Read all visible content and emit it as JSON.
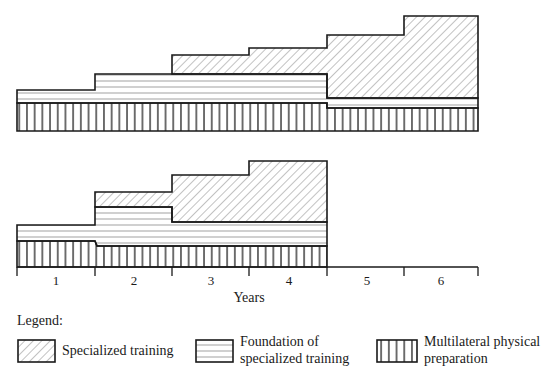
{
  "diagram": {
    "x_axis": {
      "title": "Years",
      "ticks": [
        "1",
        "2",
        "3",
        "4",
        "5",
        "6"
      ]
    },
    "top_plan": {
      "description": "Six-year training program",
      "layers": {
        "multilateral": [
          {
            "years": "1-4",
            "level": "high"
          },
          {
            "years": "5-6",
            "level": "lower"
          }
        ],
        "foundation": [
          {
            "years": "1",
            "thickness": "thin"
          },
          {
            "years": "2-4",
            "thickness": "thicker"
          },
          {
            "years": "5-6",
            "thickness": "very thin"
          }
        ],
        "specialized": [
          {
            "years": "1-2",
            "thickness": "none"
          },
          {
            "years": "3",
            "thickness": "small"
          },
          {
            "years": "4",
            "thickness": "small+"
          },
          {
            "years": "5",
            "thickness": "large"
          },
          {
            "years": "6",
            "thickness": "largest"
          }
        ]
      }
    },
    "bottom_plan": {
      "description": "Four-year training program",
      "layers": {
        "multilateral": [
          {
            "years": "1",
            "level": "high"
          },
          {
            "years": "2-4",
            "level": "lower"
          }
        ],
        "foundation": [
          {
            "years": "1",
            "thickness": "thin"
          },
          {
            "years": "2",
            "thickness": "thick"
          },
          {
            "years": "3-4",
            "thickness": "medium"
          }
        ],
        "specialized": [
          {
            "years": "1",
            "thickness": "none"
          },
          {
            "years": "2",
            "thickness": "small"
          },
          {
            "years": "3",
            "thickness": "large"
          },
          {
            "years": "4",
            "thickness": "largest"
          }
        ]
      }
    }
  },
  "legend": {
    "title": "Legend:",
    "items": [
      {
        "pattern": "diagonal-hatch",
        "line1": "Specialized training",
        "line2": ""
      },
      {
        "pattern": "horizontal-lines",
        "line1": "Foundation of",
        "line2": "specialized training"
      },
      {
        "pattern": "vertical-lines",
        "line1": "Multilateral physical",
        "line2": "preparation"
      }
    ]
  },
  "colors": {
    "ink": "#1a1a1a",
    "hatch": "#555555",
    "background": "#ffffff"
  }
}
